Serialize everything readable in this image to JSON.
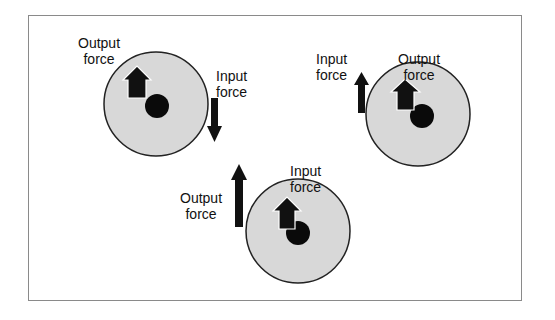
{
  "diagram": {
    "colors": {
      "frame": "#8a8a8a",
      "wheel_fill": "#d8d8d8",
      "wheel_stroke": "#222222",
      "arrow": "#111111",
      "axle": "#0a0a0a",
      "text": "#111111"
    },
    "wheels": [
      {
        "id": "wheel-1",
        "output_label": [
          "Output",
          "force"
        ],
        "input_label": [
          "Input",
          "force"
        ],
        "input_direction": "down",
        "output_direction": "up"
      },
      {
        "id": "wheel-2",
        "output_label": [
          "Output",
          "force"
        ],
        "input_label": [
          "Input",
          "force"
        ],
        "input_direction": "up",
        "output_direction": "up"
      },
      {
        "id": "wheel-3",
        "output_label": [
          "Output",
          "force"
        ],
        "input_label": [
          "Input",
          "force"
        ],
        "input_direction": "up",
        "output_direction": "up"
      }
    ]
  }
}
